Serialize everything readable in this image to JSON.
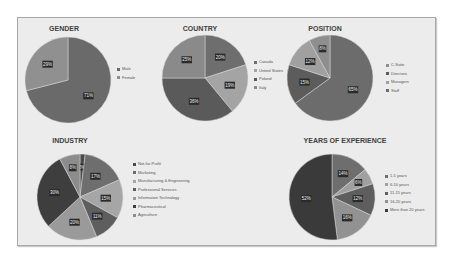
{
  "chart_data": [
    {
      "type": "pie",
      "title": "GENDER",
      "categories": [
        "Male",
        "Female"
      ],
      "values": [
        71,
        29
      ],
      "colors": [
        "#6a6a6a",
        "#909090"
      ],
      "legend_position": "right"
    },
    {
      "type": "pie",
      "title": "COUNTRY",
      "categories": [
        "Canada",
        "United States",
        "Poland",
        "Italy"
      ],
      "values": [
        20,
        19,
        36,
        25
      ],
      "colors": [
        "#6e6e6e",
        "#a4a4a4",
        "#5a5a5a",
        "#8a8a8a"
      ],
      "legend_position": "right"
    },
    {
      "type": "pie",
      "title": "POSITION",
      "categories": [
        "C-Suite",
        "Directors",
        "Managers",
        "Staff"
      ],
      "values": [
        8,
        15,
        12,
        65
      ],
      "colors": [
        "#8e8e8e",
        "#5c5c5c",
        "#a0a0a0",
        "#6c6c6c"
      ],
      "display_order_clockwise_from_top": [
        "Staff",
        "Directors",
        "Managers",
        "C-Suite"
      ],
      "legend_position": "right"
    },
    {
      "type": "pie",
      "title": "INDUSTRY",
      "categories": [
        "Not-for-Profit",
        "Marketing",
        "Manufacturing & Engineering",
        "Professional Services",
        "Information Technology",
        "Pharmaceutical",
        "Agriculture"
      ],
      "values": [
        2,
        17,
        15,
        11,
        20,
        30,
        8
      ],
      "colors": [
        "#4a4a4a",
        "#6e6e6e",
        "#a6a6a6",
        "#5e5e5e",
        "#9a9a9a",
        "#3e3e3e",
        "#8c8c8c"
      ],
      "legend_position": "right"
    },
    {
      "type": "pie",
      "title": "YEARS OF EXPERIENCE",
      "categories": [
        "1-5 years",
        "6-10 years",
        "11-15 years",
        "16-20 years",
        "More than 20 years"
      ],
      "values": [
        14,
        6,
        12,
        16,
        52
      ],
      "colors": [
        "#6e6e6e",
        "#a0a0a0",
        "#5e5e5e",
        "#929292",
        "#3a3a3a"
      ],
      "legend_position": "right"
    }
  ]
}
